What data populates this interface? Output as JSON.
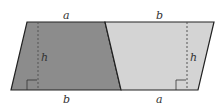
{
  "diagram": {
    "colors": {
      "left_fill": "#8c8c8c",
      "right_fill": "#d4d4d4",
      "stroke": "#222222",
      "dash": "#555555"
    },
    "labels": {
      "top_left": "a",
      "top_right": "b",
      "bottom_left": "b",
      "bottom_right": "a",
      "height_left": "h",
      "height_right": "h"
    }
  }
}
